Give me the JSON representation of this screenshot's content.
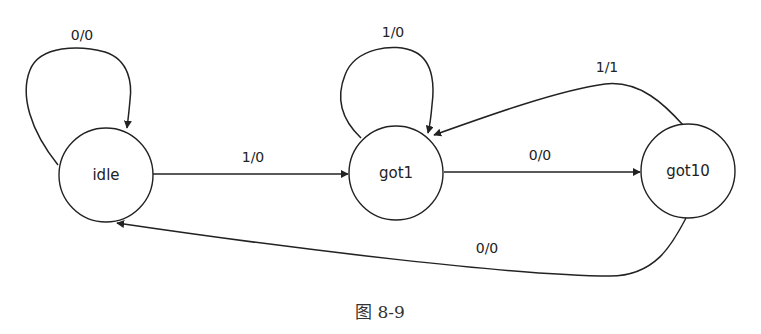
{
  "diagram": {
    "type": "state-machine",
    "states": [
      {
        "id": "idle",
        "label": "idle",
        "cx": 106,
        "cy": 175,
        "r": 47
      },
      {
        "id": "got1",
        "label": "got1",
        "cx": 396,
        "cy": 173,
        "r": 47
      },
      {
        "id": "got10",
        "label": "got10",
        "cx": 688,
        "cy": 171,
        "r": 47
      }
    ],
    "transitions": [
      {
        "from": "idle",
        "to": "idle",
        "label": "0/0"
      },
      {
        "from": "idle",
        "to": "got1",
        "label": "1/0"
      },
      {
        "from": "got1",
        "to": "got1",
        "label": "1/0"
      },
      {
        "from": "got1",
        "to": "got10",
        "label": "0/0"
      },
      {
        "from": "got10",
        "to": "got1",
        "label": "1/1"
      },
      {
        "from": "got10",
        "to": "idle",
        "label": "0/0"
      }
    ],
    "caption": "图 8-9"
  }
}
